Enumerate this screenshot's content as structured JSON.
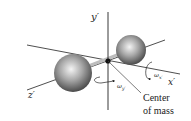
{
  "diagram": {
    "axes": {
      "x": "x′",
      "y": "y′",
      "z": "z′"
    },
    "angular_velocities": {
      "x": "ω",
      "x_sub": "x′",
      "y": "ω",
      "y_sub": "y′"
    },
    "center_of_mass_label": {
      "line1": "Center",
      "line2": "of mass"
    },
    "colors": {
      "line": "#222222",
      "sphere_light": "#f2f2f2",
      "sphere_mid": "#9a9a9a",
      "sphere_dark": "#3a3a3a",
      "rod": "#bdbdbd"
    }
  }
}
